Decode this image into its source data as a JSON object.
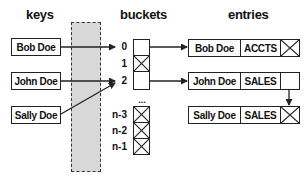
{
  "headers": {
    "keys": "keys",
    "buckets": "buckets",
    "entries": "entries"
  },
  "keys": [
    {
      "label": "Bob Doe",
      "bucket": "0"
    },
    {
      "label": "John Doe",
      "bucket": "2"
    },
    {
      "label": "Sally Doe",
      "bucket": "2"
    }
  ],
  "buckets": [
    {
      "index": "0",
      "state": "pointer"
    },
    {
      "index": "1",
      "state": "null"
    },
    {
      "index": "2",
      "state": "pointer"
    },
    {
      "index": "...",
      "state": "ellipsis"
    },
    {
      "index": "n-3",
      "state": "null"
    },
    {
      "index": "n-2",
      "state": "null"
    },
    {
      "index": "n-1",
      "state": "null"
    }
  ],
  "ellipsis": "...",
  "entries": [
    {
      "name": "Bob Doe",
      "dept": "ACCTS",
      "next": "null"
    },
    {
      "name": "John Doe",
      "dept": "SALES",
      "next": "Sally Doe"
    },
    {
      "name": "Sally Doe",
      "dept": "SALES",
      "next": "null"
    }
  ],
  "colors": {
    "line": "#222222",
    "hash_column_fill": "#d8d8d8",
    "background": "#ffffff"
  }
}
